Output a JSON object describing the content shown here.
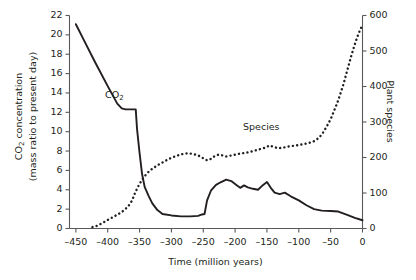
{
  "chart_data": {
    "type": "line",
    "title": "",
    "xlabel": "Time (million years)",
    "ylabel": "CO2 concentration (mass ratio to present day)",
    "ylabel_right": "Plant species",
    "xlim": [
      -460,
      0
    ],
    "ylim": [
      0,
      22
    ],
    "ylim_right": [
      0,
      600
    ],
    "xticks": [
      -450,
      -400,
      -350,
      -300,
      -250,
      -200,
      -150,
      -100,
      -50,
      0
    ],
    "xticklabels": [
      "–450",
      "–400",
      "–350",
      "–300",
      "–250",
      "–200",
      "–150",
      "–100",
      "–50",
      "0"
    ],
    "yticks": [
      0,
      2,
      4,
      6,
      8,
      10,
      12,
      14,
      16,
      18,
      20,
      22
    ],
    "yticklabels": [
      "0",
      "2",
      "4",
      "6",
      "8",
      "10",
      "12",
      "14",
      "16",
      "18",
      "20",
      "22"
    ],
    "yticks_right": [
      0,
      100,
      200,
      300,
      400,
      500,
      600
    ],
    "yticklabels_right": [
      "0",
      "100",
      "200",
      "300",
      "400",
      "500",
      "600"
    ],
    "grid": false,
    "legend": "inline-annotations",
    "annotations": [
      {
        "text": "CO2",
        "x": -372,
        "y": 13.7,
        "name": "co2-curve-label"
      },
      {
        "text": "Species",
        "x": -175,
        "y": 9.6,
        "name": "species-curve-label"
      }
    ],
    "series": [
      {
        "name": "CO2",
        "label": "CO₂",
        "style": "solid",
        "axis": "left",
        "units": "mass ratio to present day",
        "points": [
          [
            -450,
            21.1
          ],
          [
            -437,
            19.4
          ],
          [
            -420,
            17.2
          ],
          [
            -400,
            14.7
          ],
          [
            -385,
            12.9
          ],
          [
            -378,
            12.4
          ],
          [
            -372,
            12.3
          ],
          [
            -358,
            12.3
          ],
          [
            -356,
            12.3
          ],
          [
            -354,
            10.3
          ],
          [
            -350,
            7.8
          ],
          [
            -346,
            5.6
          ],
          [
            -342,
            4.3
          ],
          [
            -336,
            3.4
          ],
          [
            -330,
            2.6
          ],
          [
            -322,
            1.9
          ],
          [
            -314,
            1.5
          ],
          [
            -300,
            1.35
          ],
          [
            -285,
            1.25
          ],
          [
            -270,
            1.25
          ],
          [
            -258,
            1.3
          ],
          [
            -252,
            1.45
          ],
          [
            -248,
            1.5
          ],
          [
            -244,
            2.9
          ],
          [
            -238,
            3.9
          ],
          [
            -230,
            4.5
          ],
          [
            -222,
            4.8
          ],
          [
            -214,
            5.05
          ],
          [
            -206,
            4.9
          ],
          [
            -198,
            4.5
          ],
          [
            -192,
            4.2
          ],
          [
            -186,
            4.45
          ],
          [
            -180,
            4.25
          ],
          [
            -172,
            4.1
          ],
          [
            -164,
            4.0
          ],
          [
            -156,
            4.5
          ],
          [
            -150,
            4.8
          ],
          [
            -144,
            4.2
          ],
          [
            -138,
            3.7
          ],
          [
            -130,
            3.55
          ],
          [
            -122,
            3.7
          ],
          [
            -112,
            3.3
          ],
          [
            -100,
            2.9
          ],
          [
            -88,
            2.4
          ],
          [
            -76,
            2.0
          ],
          [
            -64,
            1.85
          ],
          [
            -50,
            1.8
          ],
          [
            -38,
            1.75
          ],
          [
            -24,
            1.4
          ],
          [
            -12,
            1.1
          ],
          [
            0,
            0.85
          ]
        ]
      },
      {
        "name": "Species",
        "label": "Species",
        "style": "dotted",
        "axis": "right",
        "units": "number of plant species",
        "points": [
          [
            -424,
            4
          ],
          [
            -416,
            8
          ],
          [
            -410,
            14
          ],
          [
            -404,
            20
          ],
          [
            -398,
            26
          ],
          [
            -392,
            32
          ],
          [
            -386,
            38
          ],
          [
            -380,
            44
          ],
          [
            -374,
            52
          ],
          [
            -368,
            62
          ],
          [
            -362,
            78
          ],
          [
            -358,
            96
          ],
          [
            -354,
            112
          ],
          [
            -350,
            126
          ],
          [
            -345,
            140
          ],
          [
            -340,
            152
          ],
          [
            -334,
            163
          ],
          [
            -327,
            172
          ],
          [
            -320,
            180
          ],
          [
            -312,
            188
          ],
          [
            -304,
            196
          ],
          [
            -296,
            202
          ],
          [
            -290,
            206
          ],
          [
            -282,
            210
          ],
          [
            -274,
            212
          ],
          [
            -266,
            210
          ],
          [
            -258,
            206
          ],
          [
            -250,
            198
          ],
          [
            -244,
            192
          ],
          [
            -238,
            196
          ],
          [
            -232,
            204
          ],
          [
            -226,
            208
          ],
          [
            -220,
            206
          ],
          [
            -214,
            203
          ],
          [
            -208,
            205
          ],
          [
            -200,
            208
          ],
          [
            -192,
            211
          ],
          [
            -184,
            213
          ],
          [
            -176,
            216
          ],
          [
            -168,
            220
          ],
          [
            -160,
            224
          ],
          [
            -152,
            228
          ],
          [
            -146,
            234
          ],
          [
            -140,
            230
          ],
          [
            -132,
            226
          ],
          [
            -124,
            228
          ],
          [
            -116,
            231
          ],
          [
            -108,
            233
          ],
          [
            -100,
            235
          ],
          [
            -92,
            238
          ],
          [
            -84,
            241
          ],
          [
            -76,
            246
          ],
          [
            -68,
            256
          ],
          [
            -62,
            270
          ],
          [
            -56,
            288
          ],
          [
            -50,
            308
          ],
          [
            -45,
            330
          ],
          [
            -40,
            352
          ],
          [
            -35,
            378
          ],
          [
            -30,
            406
          ],
          [
            -26,
            432
          ],
          [
            -22,
            458
          ],
          [
            -18,
            484
          ],
          [
            -14,
            508
          ],
          [
            -10,
            530
          ],
          [
            -6,
            550
          ],
          [
            -2,
            566
          ],
          [
            0,
            572
          ]
        ]
      }
    ]
  },
  "labels": {
    "co2_label_main": "CO",
    "co2_label_sub": "2",
    "species_label": "Species",
    "ylabel_left_line1_main": "CO",
    "ylabel_left_line1_sub": "2",
    "ylabel_left_line1_rest": " concentration",
    "ylabel_left_line2": "(mass ratio to present day)",
    "ylabel_right": "Plant species",
    "xlabel": "Time (million years)"
  },
  "style": {
    "line_color": "#231f20",
    "axis_color": "#58595b",
    "text_color": "#231f20",
    "background": "#ffffff"
  }
}
